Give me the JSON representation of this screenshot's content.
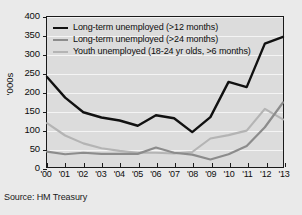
{
  "source_note": "Source: HM Treasury",
  "chart_data": {
    "type": "line",
    "title": "",
    "xlabel": "",
    "ylabel": "'000s",
    "ylim": [
      0,
      400
    ],
    "yticks": [
      0,
      50,
      100,
      150,
      200,
      250,
      300,
      350,
      400
    ],
    "ytick_labels": [
      "0",
      "50",
      "100",
      "150",
      "200",
      "250",
      "300",
      "350",
      "400"
    ],
    "grid": true,
    "legend_position": "top-left",
    "categories": [
      "'00",
      "'01",
      "'02",
      "'03",
      "'04",
      "'05",
      "'06",
      "'07",
      "'08",
      "'09",
      "'10",
      "'11",
      "'12",
      "'13"
    ],
    "x": [
      2000,
      2001,
      2002,
      2003,
      2004,
      2005,
      2006,
      2007,
      2008,
      2009,
      2010,
      2011,
      2012,
      2013
    ],
    "series": [
      {
        "name": "Long-term unemployed (>12 months)",
        "color": "#111111",
        "width": 2.4,
        "values": [
          240,
          185,
          146,
          132,
          124,
          110,
          138,
          130,
          93,
          133,
          227,
          213,
          329,
          347
        ]
      },
      {
        "name": "Long-term unemployed (>24 months)",
        "color": "#8c8c8c",
        "width": 2.2,
        "values": [
          41,
          34,
          38,
          35,
          35,
          35,
          52,
          38,
          33,
          20,
          34,
          56,
          106,
          172
        ]
      },
      {
        "name": "Youth unemployed (18-24 yr olds, >6 months)",
        "color": "#b4b4b4",
        "width": 2.2,
        "values": [
          117,
          84,
          63,
          50,
          43,
          38,
          38,
          36,
          40,
          76,
          85,
          97,
          155,
          127
        ]
      }
    ]
  }
}
